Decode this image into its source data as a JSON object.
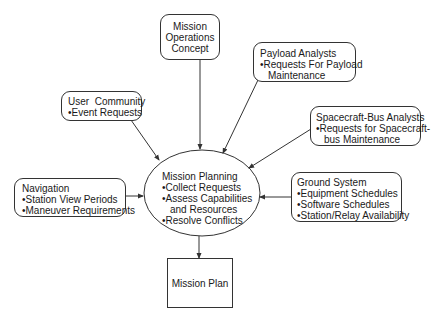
{
  "diagram": {
    "nodes": {
      "mission_ops_concept": {
        "lines": [
          "Mission",
          "Operations",
          "Concept"
        ]
      },
      "payload_analysts": {
        "title": "Payload Analysts",
        "bullets": [
          [
            "Requests For Payload",
            "Maintenance"
          ]
        ]
      },
      "user_community": {
        "title": "User  Community",
        "bullets": [
          [
            "Event Requests"
          ]
        ]
      },
      "spacecraft_bus_analysts": {
        "title": "Spacecraft-Bus Analysts",
        "bullets": [
          [
            "Requests for Spacecraft-",
            "bus Maintenance"
          ]
        ]
      },
      "navigation": {
        "title": "Navigation",
        "bullets": [
          [
            "Station View Periods"
          ],
          [
            "Maneuver Requirements"
          ]
        ]
      },
      "mission_planning": {
        "title": "Mission Planning",
        "bullets": [
          [
            "Collect Requests"
          ],
          [
            "Assess Capabilities",
            "and Resources"
          ],
          [
            "Resolve Conflicts"
          ]
        ]
      },
      "ground_system": {
        "title": "Ground System",
        "bullets": [
          [
            "Equipment Schedules"
          ],
          [
            "Software Schedules"
          ],
          [
            "Station/Relay Availability"
          ]
        ]
      },
      "mission_plan": {
        "label": "Mission Plan"
      }
    },
    "edges": [
      {
        "from": "Mission Operations Concept",
        "to": "Mission Planning"
      },
      {
        "from": "Payload Analysts",
        "to": "Mission Planning"
      },
      {
        "from": "User Community",
        "to": "Mission Planning"
      },
      {
        "from": "Spacecraft-Bus Analysts",
        "to": "Mission Planning"
      },
      {
        "from": "Navigation",
        "to": "Mission Planning"
      },
      {
        "from": "Ground System",
        "to": "Mission Planning"
      },
      {
        "from": "Mission Planning",
        "to": "Mission Plan"
      }
    ],
    "colors": {
      "line": "#333333",
      "text": "#1a1a1a",
      "background": "#ffffff"
    }
  }
}
